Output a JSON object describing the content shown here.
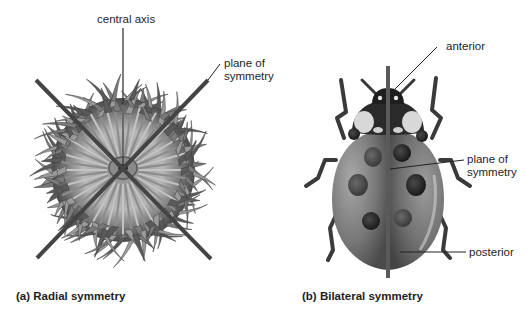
{
  "figure": {
    "panel_a": {
      "caption_tag": "(a)",
      "caption_text": "Radial symmetry",
      "labels": {
        "central_axis": "central axis",
        "plane_line1": "plane of",
        "plane_line2": "symmetry"
      },
      "subject": "sea anemone"
    },
    "panel_b": {
      "caption_tag": "(b)",
      "caption_text": "Bilateral symmetry",
      "labels": {
        "anterior": "anterior",
        "plane_line1": "plane of",
        "plane_line2": "symmetry",
        "posterior": "posterior"
      },
      "subject": "ladybug"
    }
  },
  "colors": {
    "background": "#ffffff",
    "line": "#3a3a3a",
    "plane_bar": "#555555",
    "text": "#1e1e1e"
  }
}
